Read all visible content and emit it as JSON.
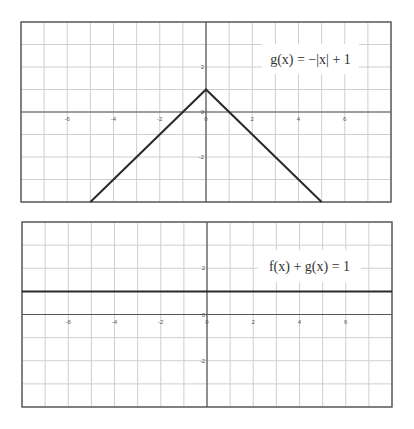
{
  "chart_data": [
    {
      "type": "line",
      "title": "g(x) = −|x| + 1",
      "annotation": "g(x) = −|x| + 1",
      "annotation_parts": [
        "g",
        "(",
        "x",
        ") = −|",
        "x",
        "| + 1"
      ],
      "xlabel": "",
      "ylabel": "",
      "xlim": [
        -8,
        8
      ],
      "ylim": [
        -4,
        4
      ],
      "grid": true,
      "x_tick_labels": [
        "-6",
        "-4",
        "-2",
        "0",
        "2",
        "4",
        "6"
      ],
      "y_tick_labels": [
        "2",
        "0",
        "-2"
      ],
      "series": [
        {
          "name": "g(x) = −|x| + 1",
          "x": [
            -5,
            0,
            5
          ],
          "y": [
            -4,
            1,
            -4
          ]
        }
      ],
      "frame": {
        "left": 21,
        "top": 22,
        "right": 391,
        "bottom": 202
      },
      "label_box": {
        "x": 262,
        "y": 44,
        "w": 97,
        "h": 30
      }
    },
    {
      "type": "line",
      "title": "f(x) + g(x) = 1",
      "annotation": "f(x) + g(x) = 1",
      "xlabel": "",
      "ylabel": "",
      "xlim": [
        -8,
        8
      ],
      "ylim": [
        -4,
        4
      ],
      "grid": true,
      "x_tick_labels": [
        "-6",
        "-4",
        "-2",
        "0",
        "2",
        "4",
        "6"
      ],
      "y_tick_labels": [
        "2",
        "0",
        "-2"
      ],
      "series": [
        {
          "name": "f(x) + g(x) = 1",
          "x": [
            -8,
            8
          ],
          "y": [
            1,
            1
          ]
        }
      ],
      "frame": {
        "left": 22,
        "top": 21,
        "right": 392,
        "bottom": 206
      },
      "label_box": {
        "x": 258,
        "y": 49,
        "w": 103,
        "h": 32
      }
    }
  ]
}
